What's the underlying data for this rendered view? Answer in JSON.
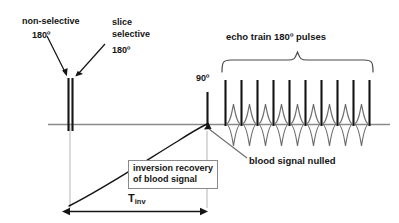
{
  "figure": {
    "type": "timing-diagram"
  },
  "labels": {
    "nonselective": "non-selective",
    "nonselective_angle": "180º",
    "slice_selective_line1": "slice",
    "slice_selective_line2": "selective",
    "slice_selective_angle": "180º",
    "excitation_angle": "90º",
    "echo_train": "echo train 180º pulses",
    "blood_nulled": "blood signal nulled",
    "inversion_recovery_line1": "inversion recovery",
    "inversion_recovery_line2": "of blood signal",
    "tinv_base": "T",
    "tinv_sub": "inv"
  },
  "colors": {
    "ink": "#141414",
    "axis": "#8a8a8a",
    "echo": "#6d6d6d",
    "box_border": "#8a8a8a",
    "background": "#ffffff"
  },
  "geometry": {
    "width": 399,
    "height": 223,
    "baseline_y": 124,
    "baseline_x_start": 48,
    "baseline_x_end": 390,
    "inversion_pulse_x": [
      68,
      72
    ],
    "inversion_pulse_top_y": 78,
    "inversion_pulse_bottom_y": 130,
    "excitation_pulse_x": 207,
    "excitation_pulse_top_y": 92,
    "echo_pulse_top_y": 80,
    "echo_pulse_x": [
      225,
      241,
      257,
      273,
      289,
      305,
      321,
      337,
      353,
      369
    ],
    "echo_count": 10,
    "echo_signal_centers_x": [
      233,
      249,
      265,
      281,
      297,
      313,
      329,
      345,
      361
    ],
    "echo_signal_amplitude": 22,
    "brace_left_x": 222,
    "brace_right_x": 373,
    "brace_y": 72,
    "tinv_arrow_y": 211,
    "tinv_arrow_x_start": 63,
    "tinv_arrow_x_end": 207,
    "recovery_start": [
      68,
      205
    ],
    "recovery_end": [
      207,
      124
    ]
  }
}
